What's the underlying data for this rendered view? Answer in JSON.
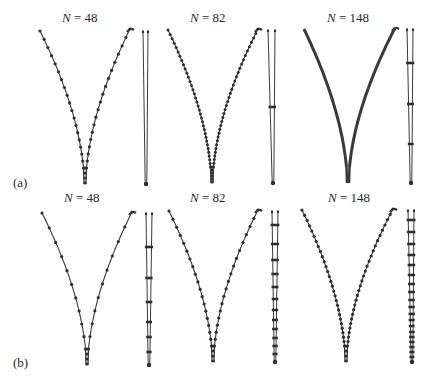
{
  "figure": {
    "rows": [
      {
        "label": "(a)",
        "panels": [
          {
            "title_var": "N",
            "title_eq": " = ",
            "title_val": "48",
            "N": 48,
            "left_tip": [
              40,
              31
            ],
            "right_tip": [
              130,
              29
            ],
            "cusp": [
              85,
              184
            ],
            "stick": {
              "x1": 143,
              "x2": 148,
              "bottom": [
                146,
                184
              ]
            },
            "curve_beads": 18,
            "stick_beads": []
          },
          {
            "title_var": "N",
            "title_eq": " = ",
            "title_val": "82",
            "N": 82,
            "left_tip": [
              168,
              30
            ],
            "right_tip": [
              258,
              29
            ],
            "cusp": [
              212,
              183
            ],
            "stick": {
              "x1": 268,
              "x2": 275,
              "bottom": [
                273,
                183
              ]
            },
            "curve_beads": 34,
            "stick_beads": [
              107
            ]
          },
          {
            "title_var": "N",
            "title_eq": " = ",
            "title_val": "148",
            "N": 148,
            "left_tip": [
              304,
              29
            ],
            "right_tip": [
              395,
              28
            ],
            "cusp": [
              348,
              183
            ],
            "stick": {
              "x1": 407,
              "x2": 413,
              "bottom": [
                411,
                183
              ]
            },
            "curve_beads": 70,
            "stick_beads": [
              63,
              104,
              144
            ]
          }
        ]
      },
      {
        "label": "(b)",
        "panels": [
          {
            "title_var": "N",
            "title_eq": " = ",
            "title_val": "48",
            "N": 48,
            "left_tip": [
              42,
              213
            ],
            "right_tip": [
              132,
              212
            ],
            "cusp": [
              87,
              365
            ],
            "stick": {
              "x1": 146,
              "x2": 152,
              "bottom": [
                149,
                365
              ]
            },
            "curve_beads": 10,
            "stick_beads": [
              247,
              278,
              302,
              322,
              337,
              352
            ]
          },
          {
            "title_var": "N",
            "title_eq": " = ",
            "title_val": "82",
            "N": 82,
            "left_tip": [
              169,
              211
            ],
            "right_tip": [
              258,
              210
            ],
            "cusp": [
              213,
              362
            ],
            "stick": {
              "x1": 272,
              "x2": 278,
              "bottom": [
                275,
                362
              ]
            },
            "curve_beads": 18,
            "stick_beads": [
              225,
              244,
              260,
              274,
              287,
              299,
              310,
              320,
              329,
              338,
              346,
              354
            ]
          },
          {
            "title_var": "N",
            "title_eq": " = ",
            "title_val": "148",
            "N": 148,
            "left_tip": [
              302,
              210
            ],
            "right_tip": [
              393,
              209
            ],
            "cusp": [
              346,
              362
            ],
            "stick": {
              "x1": 408,
              "x2": 414,
              "bottom": [
                412,
                362
              ]
            },
            "curve_beads": 28,
            "stick_beads": [
              220,
              232,
              244,
              255,
              265,
              275,
              284,
              292,
              300,
              307,
              314,
              320,
              326,
              332,
              337,
              342,
              347,
              352,
              357
            ]
          }
        ]
      }
    ],
    "colors": {
      "ink": "#3a3a3a",
      "bead": "#2e2e2e",
      "text": "#2a2a2a"
    }
  }
}
